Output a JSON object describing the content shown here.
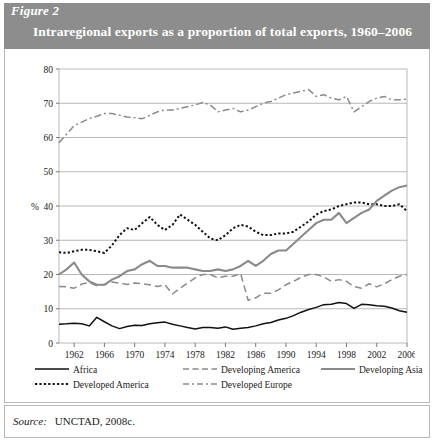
{
  "figure": {
    "label": "Figure 2",
    "title": "Intraregional exports as a proportion of total exports, 1960–2006",
    "source_word": "Source:",
    "source_value": "UNCTAD, 2008c."
  },
  "colors": {
    "header_band": "#8d8d8d",
    "frame": "#b9b9b9",
    "grid": "#9a9a9a",
    "axis": "#555555",
    "black_series": "#111111",
    "gray_series": "#8a8a8a"
  },
  "legend": {
    "items": [
      {
        "label": "Africa",
        "style": "solid",
        "color": "#111111",
        "name": "africa"
      },
      {
        "label": "Developing America",
        "style": "dashed",
        "color": "#8a8a8a",
        "name": "developing-america"
      },
      {
        "label": "Developing Asia",
        "style": "solid",
        "color": "#8a8a8a",
        "name": "developing-asia"
      },
      {
        "label": "Developed America",
        "style": "dotted",
        "color": "#111111",
        "name": "developed-america"
      },
      {
        "label": "Developed Europe",
        "style": "dashdot",
        "color": "#8a8a8a",
        "name": "developed-europe"
      }
    ]
  },
  "chart_data": {
    "type": "line",
    "title": "Intraregional exports as a proportion of total exports, 1960–2006",
    "xlabel": "",
    "ylabel": "%",
    "ylim": [
      0,
      80
    ],
    "ytick_step": 10,
    "yticks": [
      0,
      10,
      20,
      30,
      40,
      50,
      60,
      70,
      80
    ],
    "xlim": [
      1960,
      2006
    ],
    "xticks": [
      1962,
      1966,
      1970,
      1974,
      1978,
      1982,
      1986,
      1990,
      1994,
      1998,
      2002,
      2006
    ],
    "xtick_labels": [
      "1962",
      "1966",
      "1970",
      "1974",
      "1978",
      "1982",
      "1986",
      "1990",
      "1994",
      "1998",
      "2002",
      "2006"
    ],
    "grid": "horizontal",
    "legend_position": "below",
    "x": [
      1960,
      1961,
      1962,
      1963,
      1964,
      1965,
      1966,
      1967,
      1968,
      1969,
      1970,
      1971,
      1972,
      1973,
      1974,
      1975,
      1976,
      1977,
      1978,
      1979,
      1980,
      1981,
      1982,
      1983,
      1984,
      1985,
      1986,
      1987,
      1988,
      1989,
      1990,
      1991,
      1992,
      1993,
      1994,
      1995,
      1996,
      1997,
      1998,
      1999,
      2000,
      2001,
      2002,
      2003,
      2004,
      2005,
      2006
    ],
    "series": [
      {
        "name": "Africa",
        "color": "#111111",
        "style": "solid",
        "values": [
          5.5,
          5.6,
          5.8,
          5.6,
          5.0,
          7.5,
          6.2,
          5.0,
          4.2,
          4.8,
          5.2,
          5.1,
          5.6,
          5.9,
          6.1,
          5.5,
          5.0,
          4.5,
          4.1,
          4.5,
          4.5,
          4.3,
          4.7,
          4.0,
          4.3,
          4.5,
          5.0,
          5.6,
          6.0,
          6.7,
          7.2,
          8.0,
          9.0,
          9.8,
          10.4,
          11.2,
          11.3,
          11.8,
          11.5,
          10.1,
          11.3,
          11.2,
          10.9,
          10.7,
          10.2,
          9.4,
          9.0
        ]
      },
      {
        "name": "Developing America",
        "color": "#8a8a8a",
        "style": "dashed",
        "values": [
          16.5,
          16.4,
          16.0,
          17.2,
          17.7,
          16.7,
          17.1,
          17.8,
          17.5,
          17.1,
          17.5,
          17.3,
          17.0,
          16.5,
          17.0,
          14.3,
          16.0,
          17.5,
          19.0,
          20.0,
          20.0,
          19.0,
          19.5,
          19.5,
          20.3,
          12.5,
          13.2,
          14.5,
          14.5,
          15.5,
          17.0,
          18.0,
          19.2,
          20.0,
          20.0,
          19.3,
          18.0,
          18.5,
          18.0,
          16.5,
          16.0,
          17.3,
          16.4,
          17.3,
          18.5,
          19.5,
          20.0
        ]
      },
      {
        "name": "Developing Asia",
        "color": "#8a8a8a",
        "style": "solid",
        "values": [
          20.0,
          21.5,
          23.5,
          20.0,
          18.0,
          17.0,
          17.0,
          18.5,
          19.5,
          21.0,
          21.5,
          23.0,
          24.0,
          22.5,
          22.5,
          22.0,
          22.0,
          22.0,
          21.5,
          21.0,
          21.0,
          21.5,
          21.0,
          21.5,
          22.5,
          24.0,
          22.5,
          24.0,
          26.0,
          27.0,
          27.0,
          29.0,
          31.0,
          33.0,
          35.0,
          36.0,
          36.0,
          38.0,
          35.0,
          36.5,
          38.0,
          39.0,
          41.5,
          43.0,
          44.5,
          45.5,
          46.0
        ]
      },
      {
        "name": "Developed America",
        "color": "#111111",
        "style": "dotted",
        "values": [
          26.5,
          26.3,
          26.8,
          27.2,
          27.2,
          26.8,
          26.3,
          28.5,
          31.5,
          33.5,
          33.0,
          35.0,
          36.8,
          34.5,
          33.0,
          34.5,
          37.5,
          36.0,
          34.5,
          32.5,
          30.5,
          30.0,
          31.5,
          33.5,
          34.5,
          34.0,
          32.5,
          31.5,
          31.5,
          32.0,
          32.0,
          32.5,
          34.0,
          35.5,
          37.5,
          38.5,
          39.0,
          40.0,
          40.5,
          41.0,
          41.0,
          40.5,
          40.5,
          40.0,
          40.0,
          40.5,
          38.5
        ]
      },
      {
        "name": "Developed Europe",
        "color": "#8a8a8a",
        "style": "dashdot",
        "values": [
          58.5,
          61.0,
          63.5,
          64.5,
          65.5,
          66.2,
          67.0,
          67.0,
          66.5,
          66.0,
          65.8,
          65.5,
          66.5,
          67.5,
          68.0,
          68.0,
          68.5,
          69.0,
          69.5,
          70.2,
          69.5,
          67.5,
          68.0,
          68.5,
          67.5,
          68.0,
          69.0,
          70.0,
          70.5,
          71.5,
          72.5,
          73.0,
          73.5,
          74.0,
          72.0,
          72.5,
          71.5,
          71.0,
          72.0,
          67.5,
          69.0,
          70.5,
          71.5,
          72.0,
          71.0,
          71.0,
          71.2
        ]
      }
    ]
  }
}
